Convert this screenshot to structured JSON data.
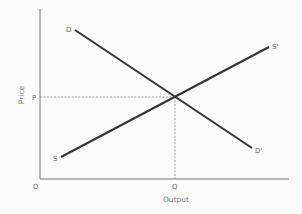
{
  "diagram": {
    "type": "supply-demand",
    "axes": {
      "x_label": "Output",
      "y_label": "Price",
      "origin_label": "O"
    },
    "curves": {
      "demand": {
        "start_label": "D",
        "end_label": "D'"
      },
      "supply": {
        "start_label": "S",
        "end_label": "S'"
      }
    },
    "equilibrium": {
      "price_label": "P",
      "quantity_label": "Q"
    },
    "colors": {
      "background": "#fbfbfb",
      "axis": "#777777",
      "curve": "#333333",
      "guide": "#888888",
      "label": "#666666"
    }
  }
}
